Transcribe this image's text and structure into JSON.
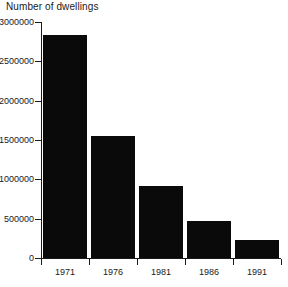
{
  "chart_data": {
    "type": "bar",
    "title": "Number of dwellings",
    "xlabel": "",
    "ylabel": "",
    "categories": [
      "1971",
      "1976",
      "1981",
      "1986",
      "1991"
    ],
    "values": [
      2830000,
      1550000,
      910000,
      470000,
      225000
    ],
    "ylim": [
      0,
      3000000
    ],
    "ytick_labels": [
      "0",
      "500000",
      "1000000",
      "1500000",
      "2000000",
      "2500000",
      "3000000"
    ],
    "ytick_values": [
      0,
      500000,
      1000000,
      1500000,
      2000000,
      2500000,
      3000000
    ],
    "grid": false,
    "legend": null,
    "bar_color": "#0a0a0a",
    "axis_color": "#1a1a1a",
    "background_color": "#ffffff"
  }
}
